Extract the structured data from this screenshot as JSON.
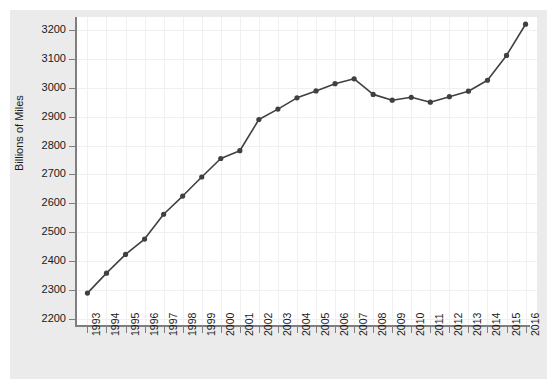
{
  "chart_data": {
    "type": "line",
    "title": "",
    "subtitle": "",
    "xlabel": "",
    "ylabel": "Billions of Miles",
    "categories": [
      "1993",
      "1994",
      "1995",
      "1996",
      "1997",
      "1998",
      "1999",
      "2000",
      "2001",
      "2002",
      "2003",
      "2004",
      "2005",
      "2006",
      "2007",
      "2008",
      "2009",
      "2010",
      "2011",
      "2012",
      "2013",
      "2014",
      "2015",
      "2016"
    ],
    "x": [
      1993,
      1994,
      1995,
      1996,
      1997,
      1998,
      1999,
      2000,
      2001,
      2002,
      2003,
      2004,
      2005,
      2006,
      2007,
      2008,
      2009,
      2010,
      2011,
      2012,
      2013,
      2014,
      2015,
      2016
    ],
    "values": [
      2289,
      2358,
      2423,
      2476,
      2562,
      2625,
      2691,
      2755,
      2782,
      2890,
      2926,
      2965,
      2989,
      3014,
      3031,
      2977,
      2957,
      2967,
      2950,
      2969,
      2988,
      3026,
      3112,
      3220
    ],
    "series": [
      {
        "name": "Vehicle Miles Traveled",
        "values": [
          2289,
          2358,
          2423,
          2476,
          2562,
          2625,
          2691,
          2755,
          2782,
          2890,
          2926,
          2965,
          2989,
          3014,
          3031,
          2977,
          2957,
          2967,
          2950,
          2969,
          2988,
          3026,
          3112,
          3220
        ],
        "color": "#404040",
        "marker": "circle"
      }
    ],
    "ylim": [
      2175,
      3245
    ],
    "xlim": [
      1992.4,
      2016.6
    ],
    "yticks": [
      2200,
      2300,
      2400,
      2500,
      2600,
      2700,
      2800,
      2900,
      3000,
      3100,
      3200
    ],
    "ytick_labels": [
      "2200",
      "2300",
      "2400",
      "2500",
      "2600",
      "2700",
      "2800",
      "2900",
      "3000",
      "3100",
      "3200"
    ],
    "xticks": [
      1993,
      1994,
      1995,
      1996,
      1997,
      1998,
      1999,
      2000,
      2001,
      2002,
      2003,
      2004,
      2005,
      2006,
      2007,
      2008,
      2009,
      2010,
      2011,
      2012,
      2013,
      2014,
      2015,
      2016
    ],
    "xtick_labels": [
      "1993",
      "1994",
      "1995",
      "1996",
      "1997",
      "1998",
      "1999",
      "2000",
      "2001",
      "2002",
      "2003",
      "2004",
      "2005",
      "2006",
      "2007",
      "2008",
      "2009",
      "2010",
      "2011",
      "2012",
      "2013",
      "2014",
      "2015",
      "2016"
    ],
    "grid": true,
    "grid_color": "#f0f0f0",
    "legend": false,
    "legend_position": "none",
    "panel_background": "#ffffff",
    "figure_background": "#ebebeb",
    "axis_color": "#7f7f7f",
    "line_width": 1.6,
    "marker_size": 4,
    "xtick_label_rotation": 90
  }
}
